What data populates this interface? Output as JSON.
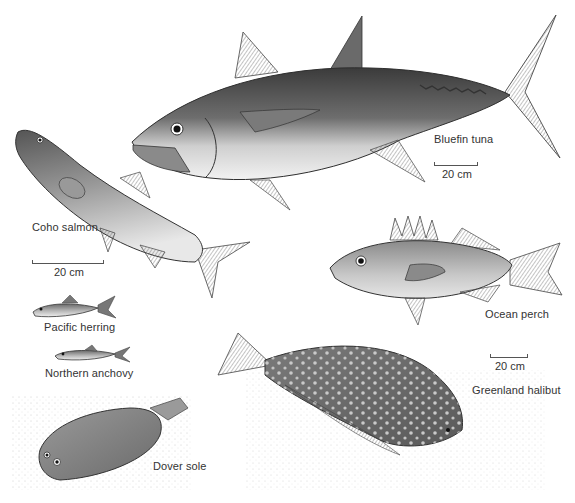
{
  "figure": {
    "background": "#ffffff",
    "ink_color": "#3a3a3a",
    "species": [
      {
        "id": "bluefin-tuna",
        "label": "Bluefin tuna",
        "scale_label": "20 cm"
      },
      {
        "id": "coho-salmon",
        "label": "Coho salmon",
        "scale_label": "20 cm"
      },
      {
        "id": "pacific-herring",
        "label": "Pacific herring"
      },
      {
        "id": "northern-anchovy",
        "label": "Northern anchovy"
      },
      {
        "id": "ocean-perch",
        "label": "Ocean perch"
      },
      {
        "id": "greenland-halibut",
        "label": "Greenland halibut",
        "scale_label": "20 cm"
      },
      {
        "id": "dover-sole",
        "label": "Dover sole"
      }
    ]
  }
}
